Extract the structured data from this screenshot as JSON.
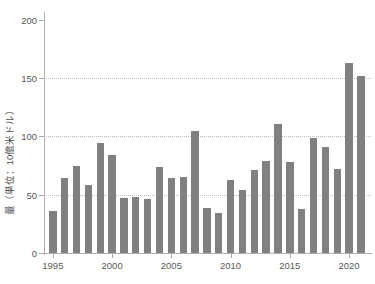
{
  "chart_data": {
    "type": "bar",
    "title": "",
    "xlabel": "",
    "ylabel": "量（単位：10億米ドル）",
    "ylim": [
      0,
      205
    ],
    "yticks": [
      0,
      50,
      100,
      150,
      200
    ],
    "ytick_labels": [
      "0",
      "50",
      "100",
      "150",
      "200"
    ],
    "xticks": [
      1995,
      2000,
      2005,
      2010,
      2015,
      2020
    ],
    "xtick_labels": [
      "1995",
      "2000",
      "2005",
      "2010",
      "2015",
      "2020"
    ],
    "grid": "horizontal-dotted-at-50-100-150",
    "legend": "none",
    "bar_color": "#808080",
    "categories": [
      "1995",
      "1996",
      "1997",
      "1998",
      "1999",
      "2000",
      "2001",
      "2002",
      "2003",
      "2004",
      "2005",
      "2006",
      "2007",
      "2008",
      "2009",
      "2010",
      "2011",
      "2012",
      "2013",
      "2014",
      "2015",
      "2016",
      "2017",
      "2018",
      "2019",
      "2020",
      "2021",
      "2022"
    ],
    "values": [
      36,
      64,
      75,
      58,
      94,
      84,
      47,
      48,
      46,
      74,
      64,
      65,
      105,
      39,
      34,
      63,
      54,
      71,
      79,
      111,
      78,
      38,
      99,
      91,
      72,
      163,
      152,
      0
    ],
    "values_display": [
      36,
      64,
      75,
      58,
      94,
      84,
      47,
      48,
      46,
      74,
      64,
      65,
      105,
      39,
      34,
      63,
      54,
      71,
      79,
      111,
      78,
      38,
      99,
      91,
      72,
      163,
      152
    ]
  },
  "axes": {
    "y_title": "量（単位：10億米ドル）"
  }
}
